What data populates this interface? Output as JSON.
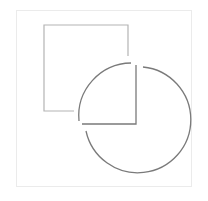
{
  "figure": {
    "colors": {
      "background": "#ffffff",
      "frame": "#ebebeb",
      "square_stroke": "#b4b4b4",
      "circle_stroke": "#7a7a7a"
    },
    "frame": {
      "x": 16,
      "y": 10,
      "width": 176,
      "height": 177
    },
    "square": {
      "x": 44,
      "y": 25,
      "width": 84,
      "height": 86
    },
    "circle": {
      "cx": 129,
      "cy": 118,
      "r": 53
    },
    "inner_corner": {
      "x": 137,
      "y": 124
    }
  }
}
